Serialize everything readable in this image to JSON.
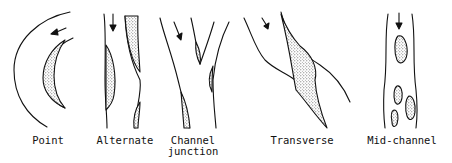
{
  "figure": {
    "panels": [
      {
        "id": "point",
        "label": "Point"
      },
      {
        "id": "alternate",
        "label": "Alternate"
      },
      {
        "id": "channel-junction",
        "label_line1": "Channel",
        "label_line2": "junction"
      },
      {
        "id": "transverse",
        "label": "Transverse"
      },
      {
        "id": "mid-channel",
        "label": "Mid-channel"
      }
    ],
    "colors": {
      "line": "#111111",
      "stipple": "#333333",
      "background": "#ffffff"
    }
  }
}
